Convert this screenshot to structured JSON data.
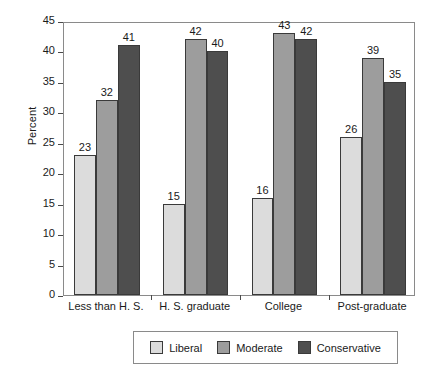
{
  "chart_data": {
    "type": "bar",
    "title": "",
    "xlabel": "",
    "ylabel": "Percent",
    "ylim": [
      0,
      45
    ],
    "yticks": [
      0,
      5,
      10,
      15,
      20,
      25,
      30,
      35,
      40,
      45
    ],
    "grid": false,
    "legend_position": "bottom",
    "categories": [
      "Less than H. S.",
      "H. S. graduate",
      "College",
      "Post-graduate"
    ],
    "series": [
      {
        "name": "Liberal",
        "color": "#dcdcdc",
        "values": [
          23,
          15,
          16,
          26
        ]
      },
      {
        "name": "Moderate",
        "color": "#9d9d9d",
        "values": [
          32,
          42,
          43,
          39
        ]
      },
      {
        "name": "Conservative",
        "color": "#4e4e4e",
        "values": [
          41,
          40,
          42,
          35
        ]
      }
    ]
  },
  "axis": {
    "y_title": "Percent",
    "y_tick_labels": [
      "0",
      "5",
      "10",
      "15",
      "20",
      "25",
      "30",
      "35",
      "40",
      "45"
    ],
    "x_tick_labels": [
      "Less than H. S.",
      "H. S. graduate",
      "College",
      "Post-graduate"
    ]
  },
  "legend": {
    "items": [
      {
        "label": "Liberal",
        "color": "#dcdcdc"
      },
      {
        "label": "Moderate",
        "color": "#9d9d9d"
      },
      {
        "label": "Conservative",
        "color": "#4e4e4e"
      }
    ]
  }
}
